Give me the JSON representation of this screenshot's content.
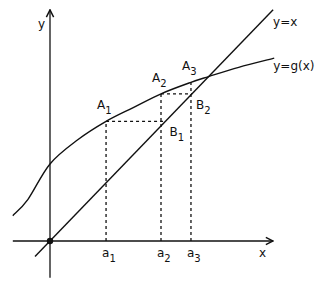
{
  "diagram": {
    "axes": {
      "x_label": "x",
      "y_label": "y"
    },
    "line_label": "y=x",
    "curve_label": "y=g(x)",
    "curve_samples": [
      [
        -0.335,
        0.22
      ],
      [
        -0.2,
        0.36
      ],
      [
        0.0,
        0.67
      ],
      [
        0.25,
        0.88
      ],
      [
        0.505,
        1.04
      ],
      [
        0.75,
        1.16
      ],
      [
        1.0,
        1.28
      ],
      [
        1.27,
        1.38
      ],
      [
        1.43,
        1.43
      ],
      [
        1.7,
        1.51
      ],
      [
        2.02,
        1.59
      ]
    ],
    "line_range": [
      -0.135,
      2.01
    ],
    "x_axis_range": [
      -0.335,
      2.01
    ],
    "y_axis_range": [
      -0.32,
      2.01
    ],
    "iterates": [
      {
        "a_label": "a",
        "a_sub": "1",
        "x": 0.505,
        "A_label": "A",
        "A_sub": "1",
        "gx": 1.04,
        "B_label": "B",
        "B_sub": "1"
      },
      {
        "a_label": "a",
        "a_sub": "2",
        "x": 1.0,
        "A_label": "A",
        "A_sub": "2",
        "gx": 1.28,
        "B_label": "B",
        "B_sub": "2"
      },
      {
        "a_label": "a",
        "a_sub": "3",
        "x": 1.27,
        "A_label": "A",
        "A_sub": "3",
        "gx": 1.38
      }
    ],
    "origin_marker": true
  }
}
